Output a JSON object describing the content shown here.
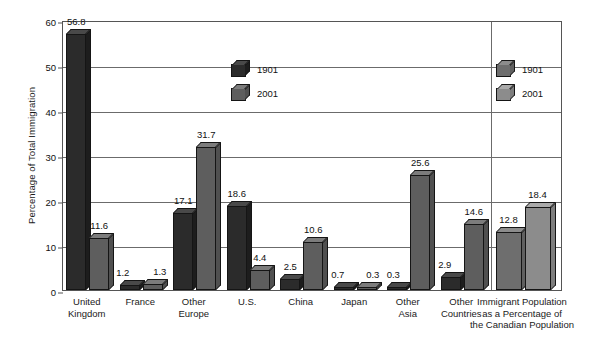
{
  "chart_data": {
    "type": "bar",
    "title": "",
    "xlabel": "",
    "ylabel": "Percentage of Total Immigration",
    "ylim": [
      0,
      60
    ],
    "yticks": [
      0,
      10,
      20,
      30,
      40,
      50,
      60
    ],
    "grid": true,
    "legend_position": "inside-plot",
    "categories": [
      "United Kingdom",
      "France",
      "Other Europe",
      "U.S.",
      "China",
      "Japan",
      "Other Asia",
      "Other Countries",
      "Immigrant Population as a Percentage of the Canadian Population"
    ],
    "series": [
      {
        "name": "1901",
        "values": [
          56.8,
          1.2,
          17.1,
          18.6,
          2.5,
          0.7,
          0.3,
          2.9,
          12.8
        ]
      },
      {
        "name": "2001",
        "values": [
          11.6,
          1.3,
          31.7,
          4.4,
          10.6,
          0.3,
          25.6,
          14.6,
          18.4
        ]
      }
    ]
  },
  "axis": {
    "y_title": "Percentage of Total Immigration",
    "y_ticks": [
      "60",
      "50",
      "40",
      "30",
      "20",
      "10",
      "0"
    ]
  },
  "categories": [
    {
      "lines": [
        "United",
        "Kingdom"
      ]
    },
    {
      "lines": [
        "France"
      ]
    },
    {
      "lines": [
        "Other",
        "Europe"
      ]
    },
    {
      "lines": [
        "U.S."
      ]
    },
    {
      "lines": [
        "China"
      ]
    },
    {
      "lines": [
        "Japan"
      ]
    },
    {
      "lines": [
        "Other",
        "Asia"
      ]
    },
    {
      "lines": [
        "Other",
        "Countries"
      ]
    },
    {
      "lines": [
        "Immigrant Population",
        "as a Percentage of",
        "the Canadian Population"
      ]
    }
  ],
  "bars": {
    "uk_1901": "56.8",
    "uk_2001": "11.6",
    "france_1901": "1.2",
    "france_2001": "1.3",
    "other_europe_1901": "17.1",
    "other_europe_2001": "31.7",
    "us_1901": "18.6",
    "us_2001": "4.4",
    "china_1901": "2.5",
    "china_2001": "10.6",
    "japan_1901": "0.7",
    "japan_2001": "0.3",
    "other_asia_1901": "0.3",
    "other_asia_2001": "25.6",
    "other_countries_1901": "2.9",
    "other_countries_2001": "14.6",
    "immigrant_pop_1901": "12.8",
    "immigrant_pop_2001": "18.4"
  },
  "legend_left": {
    "row_1901": "1901",
    "row_2001": "2001"
  },
  "legend_right": {
    "row_1901": "1901",
    "row_2001": "2001"
  },
  "colors": {
    "series_1901_left": "#2b2b2b",
    "series_2001_left": "#5e5e5e",
    "series_1901_right": "#6e6e6e",
    "series_2001_right": "#8c8c8c",
    "grid": "#6b6b6b",
    "frame": "#555555",
    "background": "#ffffff"
  }
}
